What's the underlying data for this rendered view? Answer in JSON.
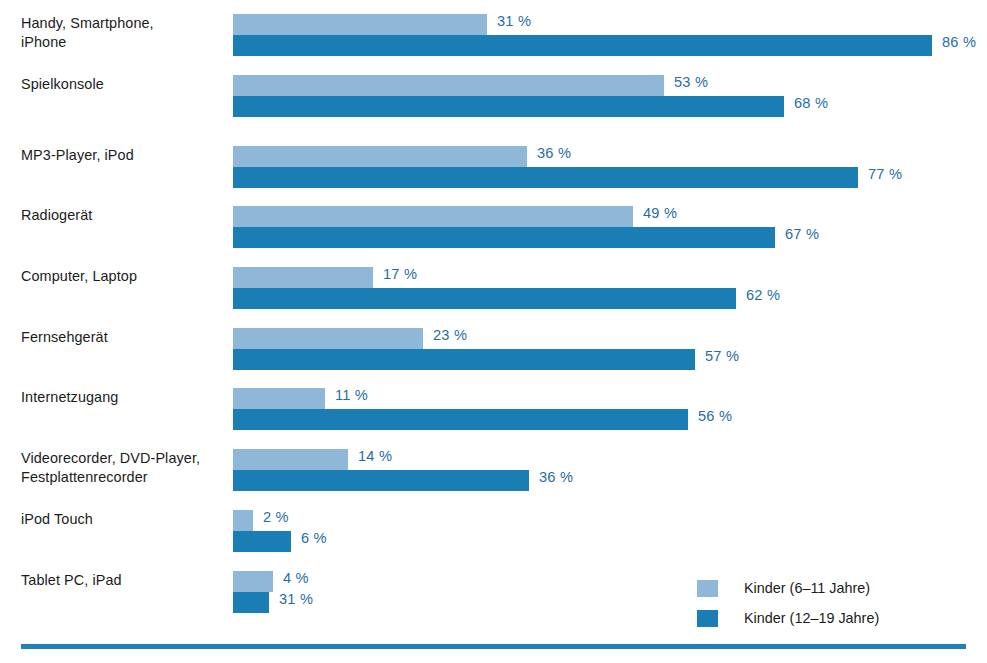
{
  "chart_data": {
    "type": "bar",
    "orientation": "horizontal",
    "title": "",
    "subtitle": "",
    "xlabel": "",
    "ylabel": "",
    "xlim": [
      0,
      100
    ],
    "grid": false,
    "legend_position": "bottom-right",
    "value_suffix": "%",
    "categories": [
      "Handy, Smartphone,\niPhone",
      "Spielkonsole",
      "MP3-Player, iPod",
      "Radiogerät",
      "Computer, Laptop",
      "Fernsehgerät",
      "Internetzugang",
      "Videorecorder, DVD-Player,\nFestplattenrecorder",
      "iPod Touch",
      "Tablet PC, iPad"
    ],
    "series": [
      {
        "name": "Kinder (6–11 Jahre)",
        "color": "#8fb8d8",
        "values": [
          31,
          53,
          36,
          49,
          17,
          23,
          11,
          14,
          2,
          4
        ],
        "labels": [
          "31 %",
          "53 %",
          "36 %",
          "49 %",
          "17 %",
          "23 %",
          "11 %",
          "14 %",
          "2 %",
          "4 %"
        ]
      },
      {
        "name": "Kinder (12–19 Jahre)",
        "color": "#1a7eb4",
        "values": [
          86,
          68,
          77,
          67,
          62,
          57,
          56,
          36,
          6,
          31
        ],
        "labels": [
          "86 %",
          "68 %",
          "77 %",
          "67 %",
          "62 %",
          "57 %",
          "56 %",
          "36 %",
          "6 %",
          "31 %"
        ]
      }
    ]
  },
  "rows": [
    {
      "label": "Handy, Smartphone,\niPhone",
      "top": 14,
      "light": {
        "value": 31,
        "label": "31 %",
        "width": 254
      },
      "dark": {
        "value": 86,
        "label": "86 %",
        "width": 699
      }
    },
    {
      "label": "Spielkonsole",
      "top": 75,
      "light": {
        "value": 53,
        "label": "53 %",
        "width": 431
      },
      "dark": {
        "value": 68,
        "label": "68 %",
        "width": 551
      }
    },
    {
      "label": "MP3-Player, iPod",
      "top": 146,
      "light": {
        "value": 36,
        "label": "36 %",
        "width": 294
      },
      "dark": {
        "value": 77,
        "label": "77 %",
        "width": 625
      }
    },
    {
      "label": "Radiogerät",
      "top": 206,
      "light": {
        "value": 49,
        "label": "49 %",
        "width": 400
      },
      "dark": {
        "value": 67,
        "label": "67 %",
        "width": 542
      }
    },
    {
      "label": "Computer, Laptop",
      "top": 267,
      "light": {
        "value": 17,
        "label": "17 %",
        "width": 140
      },
      "dark": {
        "value": 62,
        "label": "62 %",
        "width": 503
      }
    },
    {
      "label": "Fernsehgerät",
      "top": 328,
      "light": {
        "value": 23,
        "label": "23 %",
        "width": 190
      },
      "dark": {
        "value": 57,
        "label": "57 %",
        "width": 462
      }
    },
    {
      "label": "Internetzugang",
      "top": 388,
      "light": {
        "value": 11,
        "label": "11 %",
        "width": 92
      },
      "dark": {
        "value": 56,
        "label": "56 %",
        "width": 455
      }
    },
    {
      "label": "Videorecorder, DVD-Player,\nFestplattenrecorder",
      "top": 449,
      "light": {
        "value": 14,
        "label": "14 %",
        "width": 115
      },
      "dark": {
        "value": 36,
        "label": "36 %",
        "width": 296
      }
    },
    {
      "label": "iPod Touch",
      "top": 510,
      "light": {
        "value": 2,
        "label": "2 %",
        "width": 20
      },
      "dark": {
        "value": 6,
        "label": "6 %",
        "width": 58
      }
    },
    {
      "label": "Tablet PC, iPad",
      "top": 571,
      "light": {
        "value": 4,
        "label": "4 %",
        "width": 40
      },
      "dark": {
        "value": 31,
        "label": "31 %",
        "width": 36
      }
    }
  ],
  "legend": {
    "items": [
      {
        "label": "Kinder (6–11 Jahre)",
        "swatch": "light",
        "top": 0
      },
      {
        "label": "Kinder (12–19 Jahre)",
        "swatch": "dark",
        "top": 30
      }
    ]
  },
  "colors": {
    "light_blue": "#8fb8d8",
    "dark_blue": "#1a7eb4",
    "value_text": "#1f6ea5",
    "label_text": "#1b1b1b",
    "rule": "#2380b6",
    "background": "#ffffff"
  }
}
